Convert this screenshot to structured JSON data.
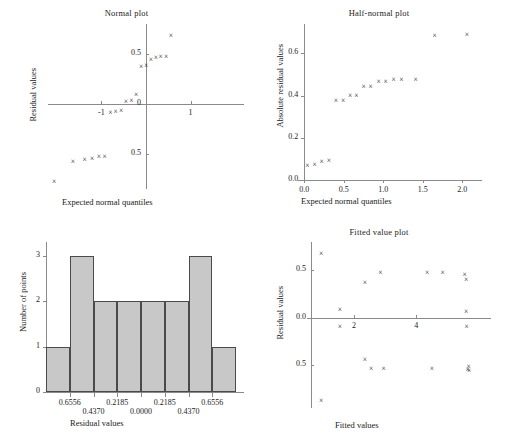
{
  "figure": {
    "panels": [
      "normal-plot",
      "half-normal-plot",
      "histogram",
      "fitted-value-plot"
    ]
  },
  "chart_data": [
    {
      "id": "normal-plot",
      "type": "scatter",
      "title": "Normal plot",
      "xlabel": "Expected normal quantiles",
      "ylabel": "Residual values",
      "xlim": [
        -2.2,
        2.2
      ],
      "ylim": [
        -0.85,
        0.8
      ],
      "xticks": [
        -1,
        1
      ],
      "xticklabels": [
        "-1",
        "1"
      ],
      "yticks": [
        -0.5,
        0,
        0.5
      ],
      "yticklabels": [
        "0.5",
        "0",
        "0.5"
      ],
      "grid": false,
      "marker": "x",
      "x": [
        -2.06,
        -1.64,
        -1.38,
        -1.21,
        -1.06,
        -0.93,
        -0.8,
        -0.68,
        -0.56,
        -0.45,
        -0.33,
        -0.22,
        -0.11,
        0.0,
        0.11,
        0.22,
        0.33,
        0.45,
        0.56,
        0.68,
        0.8,
        0.93,
        1.06,
        1.21,
        1.38,
        1.64,
        2.06
      ],
      "y": [
        -0.78,
        -0.58,
        -0.56,
        -0.55,
        -0.53,
        -0.53,
        -0.09,
        -0.08,
        -0.07,
        0.02,
        0.03,
        0.09,
        0.37,
        0.38,
        0.44,
        0.46,
        0.47,
        0.47,
        0.68
      ]
    },
    {
      "id": "half-normal-plot",
      "type": "scatter",
      "title": "Half-normal plot",
      "xlabel": "Expected normal quantiles",
      "ylabel": "Absolute residual values",
      "xlim": [
        -0.08,
        2.25
      ],
      "ylim": [
        -0.02,
        0.74
      ],
      "xticks": [
        0.0,
        0.5,
        1.0,
        1.5,
        2.0
      ],
      "xticklabels": [
        "0.0",
        "0.5",
        "1.0",
        "1.5",
        "2.0"
      ],
      "yticks": [
        0.0,
        0.2,
        0.4,
        0.6
      ],
      "yticklabels": [
        "0.0",
        "0.2",
        "0.4",
        "0.6"
      ],
      "grid": false,
      "marker": "x",
      "x": [
        0.04,
        0.13,
        0.22,
        0.31,
        0.4,
        0.49,
        0.58,
        0.66,
        0.75,
        0.84,
        0.94,
        1.03,
        1.13,
        1.23,
        1.41,
        1.65,
        2.06
      ],
      "y": [
        0.065,
        0.07,
        0.085,
        0.09,
        0.372,
        0.373,
        0.4,
        0.4,
        0.443,
        0.443,
        0.463,
        0.464,
        0.472,
        0.473,
        0.475,
        0.685,
        0.688
      ]
    },
    {
      "id": "histogram",
      "type": "bar",
      "title": "",
      "xlabel": "Residual values",
      "ylabel": "Number of points",
      "categories": [
        "-0.8741",
        "-0.6556",
        "-0.4370",
        "-0.2185",
        "0.0000",
        "0.2185",
        "0.4370",
        "0.6556"
      ],
      "values": [
        1,
        3,
        2,
        2,
        2,
        2,
        3,
        1
      ],
      "ylim": [
        0,
        3.3
      ],
      "yticks": [
        0,
        1,
        2,
        3
      ],
      "yticklabels": [
        "0",
        "1",
        "2",
        "3"
      ],
      "xticklabels_row1": [
        "0.6556",
        "0.2185",
        "0.2185",
        "0.6556"
      ],
      "xticklabels_row2": [
        "0.4370",
        "0.0000",
        "0.4370"
      ],
      "bar_fill": "#c8c8c8",
      "bar_stroke": "#4a4a4a",
      "grid": false
    },
    {
      "id": "fitted-value-plot",
      "type": "scatter",
      "title": "Fitted value plot",
      "xlabel": "Fitted values",
      "ylabel": "Residual values",
      "xlim": [
        0.3,
        6.4
      ],
      "ylim": [
        -0.95,
        0.8
      ],
      "xticks": [
        2,
        4
      ],
      "xticklabels": [
        "2",
        "4"
      ],
      "yticks": [
        -0.5,
        0.0,
        0.5
      ],
      "yticklabels": [
        "0.5",
        "0.0",
        "0.5"
      ],
      "grid": false,
      "marker": "x",
      "x": [
        0.95,
        0.95,
        1.55,
        1.55,
        2.35,
        2.35,
        2.55,
        2.85,
        2.95,
        4.35,
        4.5,
        4.85,
        5.55,
        5.6,
        5.6,
        5.62,
        5.65,
        5.68,
        5.7
      ],
      "y": [
        0.675,
        -0.88,
        0.085,
        -0.095,
        0.372,
        -0.445,
        -0.535,
        0.475,
        -0.535,
        0.473,
        -0.535,
        0.472,
        0.455,
        0.395,
        0.062,
        -0.095,
        -0.545,
        -0.515,
        -0.555
      ]
    }
  ]
}
